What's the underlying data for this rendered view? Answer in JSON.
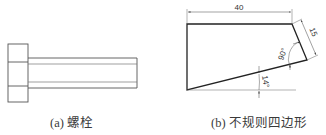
{
  "figure": {
    "left": {
      "caption": "(a) 螺栓",
      "shape": "bolt",
      "head": {
        "x": 8,
        "y": 44,
        "width": 20,
        "height": 58,
        "inner_lines_y": [
          62,
          86
        ]
      },
      "shank": {
        "x_start": 28,
        "x_end": 137,
        "outer_y": [
          58,
          88
        ],
        "thread_y": [
          64,
          82
        ]
      }
    },
    "right": {
      "caption": "(b) 不规则四边形",
      "shape": "irregular-quadrilateral",
      "vertices": [
        [
          187,
          24
        ],
        [
          292,
          24
        ],
        [
          307,
          60
        ],
        [
          187,
          90
        ]
      ],
      "dimensions": {
        "top_length": "40",
        "right_edge_length": "15",
        "right_angle": "90°",
        "bottom_angle": "14°"
      }
    },
    "colors": {
      "line": "#222222",
      "thin_line": "#666666",
      "text": "#333333"
    }
  }
}
